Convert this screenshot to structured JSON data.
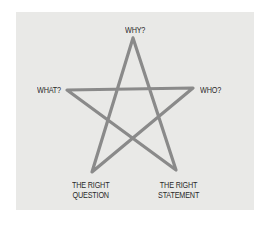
{
  "diagram": {
    "type": "pentagram",
    "line_color": "#8a8a8a",
    "background_color": "#e9e9e7",
    "vertices": {
      "top": "WHY?",
      "left": "WHAT?",
      "right": "WHO?",
      "bottom_left": [
        "THE RIGHT",
        "QUESTION"
      ],
      "bottom_right": [
        "THE RIGHT",
        "STATEMENT"
      ]
    }
  }
}
